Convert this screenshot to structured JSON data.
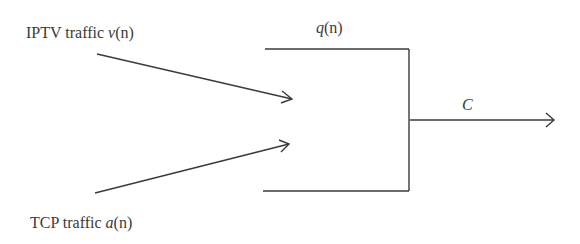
{
  "diagram": {
    "type": "queue-model",
    "inputs": [
      {
        "id": "iptv",
        "label_text": "IPTV traffic ",
        "label_var": "v",
        "label_arg": "(n)"
      },
      {
        "id": "tcp",
        "label_text": "TCP traffic ",
        "label_var": "a",
        "label_arg": "(n)"
      }
    ],
    "queue": {
      "label_var": "q",
      "label_arg": "(n)"
    },
    "output": {
      "label_var": "C"
    },
    "colors": {
      "stroke": "#3a3a3a",
      "background": "#ffffff"
    }
  }
}
